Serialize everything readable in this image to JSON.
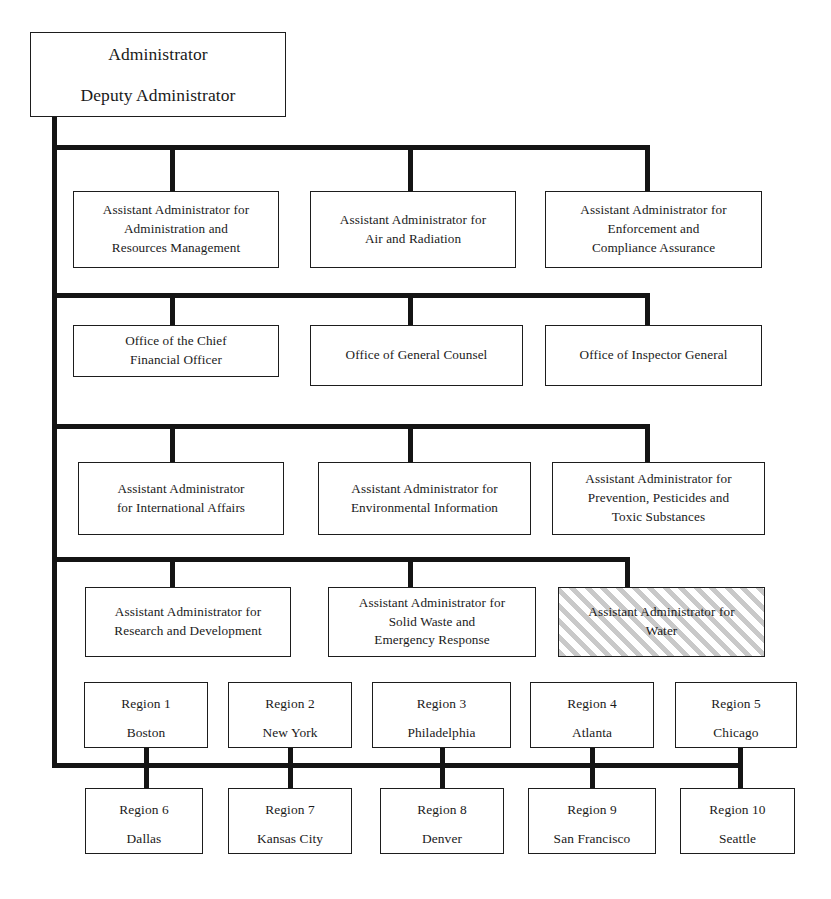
{
  "chart": {
    "type": "org-chart",
    "accent_color": "#141414",
    "highlight_fill": "#c9c9c9"
  },
  "root": {
    "line1": "Administrator",
    "line2": "Deputy Administrator"
  },
  "rows": [
    {
      "row_id": "row-assistant-administrators-1",
      "nodes": [
        {
          "id": "aa-administration-resources",
          "lines": [
            "Assistant Administrator for",
            "Administration and",
            "Resources Management"
          ],
          "highlighted": false
        },
        {
          "id": "aa-air-radiation",
          "lines": [
            "Assistant Administrator for",
            "Air and Radiation"
          ],
          "highlighted": false
        },
        {
          "id": "aa-enforcement-compliance",
          "lines": [
            "Assistant Administrator for",
            "Enforcement and",
            "Compliance Assurance"
          ],
          "highlighted": false
        }
      ]
    },
    {
      "row_id": "row-offices",
      "nodes": [
        {
          "id": "office-chief-financial-officer",
          "lines": [
            "Office of the Chief",
            "Financial Officer"
          ],
          "highlighted": false
        },
        {
          "id": "office-general-counsel",
          "lines": [
            "Office of General Counsel"
          ],
          "highlighted": false
        },
        {
          "id": "office-inspector-general",
          "lines": [
            "Office of Inspector General"
          ],
          "highlighted": false
        }
      ]
    },
    {
      "row_id": "row-assistant-administrators-2",
      "nodes": [
        {
          "id": "aa-international-affairs",
          "lines": [
            "Assistant Administrator",
            "for International Affairs"
          ],
          "highlighted": false
        },
        {
          "id": "aa-environmental-information",
          "lines": [
            "Assistant Administrator for",
            "Environmental Information"
          ],
          "highlighted": false
        },
        {
          "id": "aa-prevention-pesticides-toxic",
          "lines": [
            "Assistant Administrator for",
            "Prevention, Pesticides and",
            "Toxic Substances"
          ],
          "highlighted": false
        }
      ]
    },
    {
      "row_id": "row-assistant-administrators-3",
      "nodes": [
        {
          "id": "aa-research-development",
          "lines": [
            "Assistant Administrator for",
            "Research and Development"
          ],
          "highlighted": false
        },
        {
          "id": "aa-solid-waste-emergency",
          "lines": [
            "Assistant Administrator for",
            "Solid Waste and",
            "Emergency Response"
          ],
          "highlighted": false
        },
        {
          "id": "aa-water",
          "lines": [
            "Assistant Administrator for",
            "Water"
          ],
          "highlighted": true
        }
      ]
    }
  ],
  "regions_row_1": [
    {
      "id": "region-1",
      "number": "Region 1",
      "city": "Boston"
    },
    {
      "id": "region-2",
      "number": "Region 2",
      "city": "New York"
    },
    {
      "id": "region-3",
      "number": "Region 3",
      "city": "Philadelphia"
    },
    {
      "id": "region-4",
      "number": "Region 4",
      "city": "Atlanta"
    },
    {
      "id": "region-5",
      "number": "Region 5",
      "city": "Chicago"
    }
  ],
  "regions_row_2": [
    {
      "id": "region-6",
      "number": "Region 6",
      "city": "Dallas"
    },
    {
      "id": "region-7",
      "number": "Region 7",
      "city": "Kansas City"
    },
    {
      "id": "region-8",
      "number": "Region 8",
      "city": "Denver"
    },
    {
      "id": "region-9",
      "number": "Region 9",
      "city": "San Francisco"
    },
    {
      "id": "region-10",
      "number": "Region 10",
      "city": "Seattle"
    }
  ]
}
